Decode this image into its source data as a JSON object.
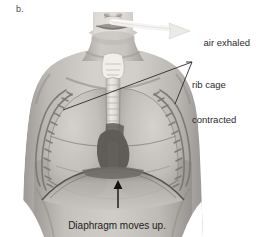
{
  "figure": {
    "panel_letter": "b.",
    "palette": {
      "background": "#ffffff",
      "skin_light": "#d8d5d2",
      "skin_mid": "#b5b2ae",
      "skin_shadow": "#8e8b88",
      "lung_fill": "#c9c7c3",
      "lung_shadow": "#a9a6a2",
      "rib_bone": "#6f6c68",
      "trachea_light": "#e4e2de",
      "heart_dark": "#4e4b48",
      "outline": "#55524f",
      "arrow_dark": "#111111",
      "arrow_light": "#f2f1ef",
      "leader_line": "#2b2b2b",
      "text": "#2b2b2b"
    }
  },
  "callouts": {
    "air_exhaled": {
      "text": "air exhaled",
      "arrow": "curved-arrow-right-light",
      "points_to": "mouth-and-nose"
    },
    "rib_cage": {
      "line1": "rib cage",
      "line2": "contracted",
      "leader": "two-leader-lines",
      "points_to": "left-and-right-rib-cage"
    },
    "diaphragm": {
      "text": "Diaphragm moves up.",
      "arrow": "arrow-up-dark",
      "points_to": "diaphragm-dome"
    }
  }
}
